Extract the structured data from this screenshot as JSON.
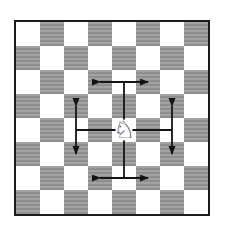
{
  "board": {
    "rows": 8,
    "cols": 8,
    "square_size_px": 24,
    "top_left_is_light": true,
    "light_square_color": "#ffffff",
    "dark_square_colors": [
      "#a2a2a2",
      "#8e8e8e"
    ],
    "border_color": "#1c1c1c"
  },
  "knight": {
    "glyph": "♘",
    "col": 4,
    "row": 4
  },
  "arrows": {
    "color": "#141414",
    "stroke_width": 1.8,
    "arrowhead": {
      "length": 9,
      "half_width": 3.5
    },
    "items": [
      {
        "name": "up-moves-arrow",
        "stem": [
          [
            4.5,
            4.5
          ],
          [
            4.5,
            2.5
          ]
        ],
        "crossbar": [
          [
            3.5,
            2.5
          ],
          [
            5.5,
            2.5
          ]
        ]
      },
      {
        "name": "down-moves-arrow",
        "stem": [
          [
            4.5,
            4.5
          ],
          [
            4.5,
            6.5
          ]
        ],
        "crossbar": [
          [
            3.5,
            6.5
          ],
          [
            5.5,
            6.5
          ]
        ]
      },
      {
        "name": "left-moves-arrow",
        "stem": [
          [
            4.5,
            4.5
          ],
          [
            2.5,
            4.5
          ]
        ],
        "crossbar": [
          [
            2.5,
            3.5
          ],
          [
            2.5,
            5.5
          ]
        ]
      },
      {
        "name": "right-moves-arrow",
        "stem": [
          [
            4.5,
            4.5
          ],
          [
            6.5,
            4.5
          ]
        ],
        "crossbar": [
          [
            6.5,
            3.5
          ],
          [
            6.5,
            5.5
          ]
        ]
      }
    ]
  }
}
